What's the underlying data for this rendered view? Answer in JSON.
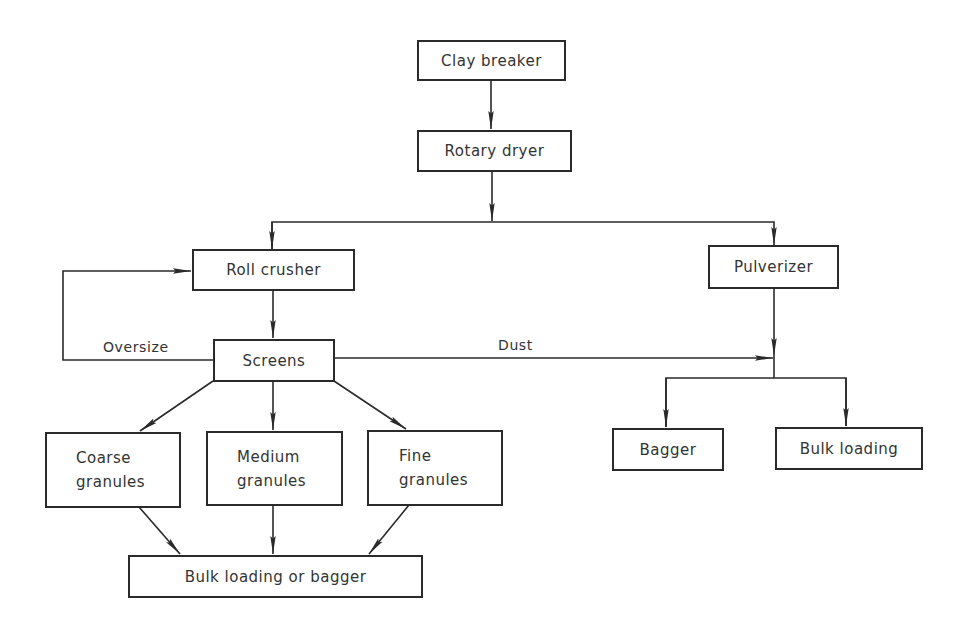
{
  "diagram": {
    "type": "process-flowchart",
    "colors": {
      "line": "#2a2a2a",
      "text": "#333333",
      "background": "#ffffff"
    },
    "nodes": {
      "clay_breaker": {
        "label": "Clay breaker"
      },
      "rotary_dryer": {
        "label": "Rotary dryer"
      },
      "roll_crusher": {
        "label": "Roll crusher"
      },
      "pulverizer": {
        "label": "Pulverizer"
      },
      "screens": {
        "label": "Screens"
      },
      "coarse_granules": {
        "line1": "Coarse",
        "line2": "granules"
      },
      "medium_granules": {
        "line1": "Medium",
        "line2": "granules"
      },
      "fine_granules": {
        "line1": "Fine",
        "line2": "granules"
      },
      "bulk_loading_or_bagger": {
        "label": "Bulk loading or bagger"
      },
      "bagger": {
        "label": "Bagger"
      },
      "bulk_loading": {
        "label": "Bulk loading"
      }
    },
    "edge_labels": {
      "oversize": "Oversize",
      "dust": "Dust"
    },
    "edges": [
      {
        "from": "Clay breaker",
        "to": "Rotary dryer"
      },
      {
        "from": "Rotary dryer",
        "to": "Roll crusher"
      },
      {
        "from": "Rotary dryer",
        "to": "Pulverizer"
      },
      {
        "from": "Roll crusher",
        "to": "Screens"
      },
      {
        "from": "Screens",
        "to": "Roll crusher",
        "label": "Oversize"
      },
      {
        "from": "Screens",
        "to": "Pulverizer output",
        "label": "Dust"
      },
      {
        "from": "Screens",
        "to": "Coarse granules"
      },
      {
        "from": "Screens",
        "to": "Medium granules"
      },
      {
        "from": "Screens",
        "to": "Fine granules"
      },
      {
        "from": "Coarse granules",
        "to": "Bulk loading or bagger"
      },
      {
        "from": "Medium granules",
        "to": "Bulk loading or bagger"
      },
      {
        "from": "Fine granules",
        "to": "Bulk loading or bagger"
      },
      {
        "from": "Pulverizer",
        "to": "Bagger"
      },
      {
        "from": "Pulverizer",
        "to": "Bulk loading"
      }
    ]
  }
}
